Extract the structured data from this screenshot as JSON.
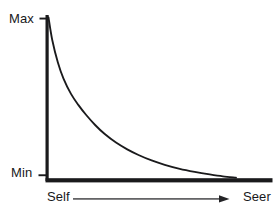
{
  "figure": {
    "background_color": "#ffffff",
    "ink_color": "#1a1a1c"
  },
  "axes": {
    "y_axis": {
      "name": "vertical-axis",
      "ticks": [
        {
          "label": "Max",
          "position": "top"
        },
        {
          "label": "Min",
          "position": "bottom"
        }
      ]
    },
    "x_axis": {
      "name": "horizontal-axis",
      "start_label": "Self",
      "end_label": "Seer",
      "arrow": "right-arrow"
    }
  },
  "chart_data": {
    "type": "line",
    "title": "",
    "subtitle": "",
    "xlabel": "",
    "ylabel": "",
    "grid": false,
    "legend": null,
    "xlim": [
      0,
      1
    ],
    "ylim": [
      0,
      1
    ],
    "x_tick_labels": [
      "Self",
      "Seer"
    ],
    "y_tick_labels": [
      "Min",
      "Max"
    ],
    "annotations": [
      {
        "text": "Self",
        "where": "x-axis-start"
      },
      {
        "text": "Seer",
        "where": "x-axis-end"
      },
      {
        "text": "Max",
        "where": "y-axis-top"
      },
      {
        "text": "Min",
        "where": "y-axis-bottom"
      }
    ],
    "series": [
      {
        "name": "decay-curve",
        "description": "monotonic exponential decay from Max at Self to Min approaching Seer",
        "color": "#1a1a1c",
        "x": [
          0.0,
          0.02,
          0.05,
          0.08,
          0.12,
          0.16,
          0.2,
          0.25,
          0.3,
          0.36,
          0.42,
          0.48,
          0.55,
          0.62,
          0.7,
          0.78,
          0.86,
          0.93,
          1.0
        ],
        "y": [
          1.0,
          0.86,
          0.72,
          0.62,
          0.525,
          0.455,
          0.395,
          0.33,
          0.275,
          0.222,
          0.18,
          0.145,
          0.111,
          0.084,
          0.059,
          0.04,
          0.024,
          0.012,
          0.004
        ]
      }
    ]
  }
}
